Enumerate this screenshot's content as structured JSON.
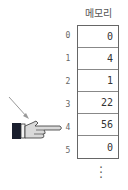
{
  "memory": {
    "title": "메모리",
    "cells": [
      {
        "index": "0",
        "value": "0"
      },
      {
        "index": "1",
        "value": "4"
      },
      {
        "index": "2",
        "value": "1"
      },
      {
        "index": "3",
        "value": "22"
      },
      {
        "index": "4",
        "value": "56"
      },
      {
        "index": "5",
        "value": "0"
      }
    ],
    "continuation": "⋮"
  },
  "pointer": {
    "icon": "pointing-hand-icon",
    "target_index": "4",
    "arrow_icon": "arrow-icon"
  }
}
